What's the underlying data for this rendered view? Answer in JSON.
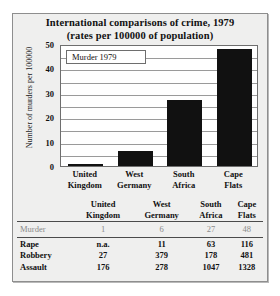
{
  "chart_data": {
    "type": "bar",
    "title": "International comparisons of crime, 1979",
    "subtitle": "(rates per 100000 of population)",
    "categories": [
      "United Kingdom",
      "West Germany",
      "South Africa",
      "Cape Flats"
    ],
    "category_lines": [
      [
        "United",
        "Kingdom"
      ],
      [
        "West",
        "Germany"
      ],
      [
        "South",
        "Africa"
      ],
      [
        "Cape",
        "Flats"
      ]
    ],
    "values": [
      1,
      6,
      27,
      48
    ],
    "series_name": "Murder 1979",
    "xlabel": "",
    "ylabel": "Number of murders per 100000",
    "ylim": [
      0,
      50
    ],
    "yticks": [
      0,
      10,
      20,
      30,
      40,
      50
    ],
    "gridline_interval": 5,
    "grid": true,
    "legend_position": "top-left",
    "bar_color": "#111111"
  },
  "table": {
    "corner_label": "",
    "columns": [
      [
        "United",
        "Kingdom"
      ],
      [
        "West",
        "Germany"
      ],
      [
        "South",
        "Africa"
      ],
      [
        "Cape",
        "Flats"
      ]
    ],
    "rows": [
      {
        "label": "Murder",
        "values": [
          "1",
          "6",
          "27",
          "48"
        ]
      },
      {
        "label": "Rape",
        "values": [
          "n.a.",
          "11",
          "63",
          "116"
        ]
      },
      {
        "label": "Robbery",
        "values": [
          "27",
          "379",
          "178",
          "481"
        ]
      },
      {
        "label": "Assault",
        "values": [
          "176",
          "278",
          "1047",
          "1328"
        ]
      }
    ]
  }
}
